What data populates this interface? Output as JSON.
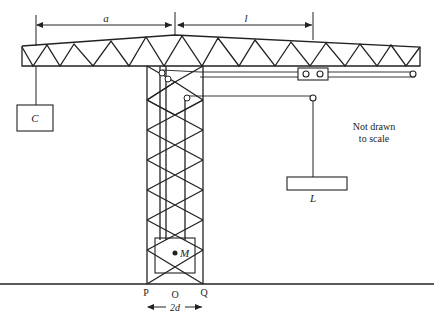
{
  "diagram": {
    "labels": {
      "dimension_a": "a",
      "dimension_l": "l",
      "counterweight": "C",
      "load": "L",
      "tower_mass": "M",
      "point_p": "P",
      "point_o": "O",
      "point_q": "Q",
      "base_width": "2d",
      "note_line1": "Not drawn",
      "note_line2": "to scale"
    },
    "colors": {
      "stroke": "#222222",
      "background": "#ffffff"
    }
  }
}
